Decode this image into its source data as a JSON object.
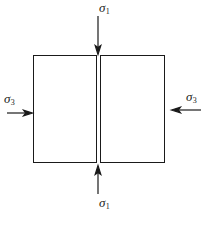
{
  "figure": {
    "background_color": "#ffffff",
    "stroke_color": "#1a1a1a",
    "width": 206,
    "height": 229
  },
  "specimen": {
    "name": "split-rectangular-specimen",
    "blocks": [
      {
        "id": "left-block",
        "x": 33,
        "y": 55,
        "width": 64,
        "height": 108
      },
      {
        "id": "right-block",
        "x": 100,
        "y": 55,
        "width": 65,
        "height": 108
      }
    ],
    "split_gap_px": 3
  },
  "stresses": [
    {
      "id": "sigma1-top",
      "symbol": "σ",
      "subscript": "1",
      "label": "σ1",
      "direction": "down",
      "position": "top",
      "arrow": {
        "x1": 98,
        "y1": 16,
        "x2": 98,
        "y2": 53
      }
    },
    {
      "id": "sigma1-bottom",
      "symbol": "σ",
      "subscript": "1",
      "label": "σ1",
      "direction": "up",
      "position": "bottom",
      "arrow": {
        "x1": 98,
        "y1": 194,
        "x2": 98,
        "y2": 166
      }
    },
    {
      "id": "sigma3-left",
      "symbol": "σ",
      "subscript": "3",
      "label": "σ3",
      "direction": "right",
      "position": "left",
      "arrow": {
        "x1": 7,
        "y1": 113,
        "x2": 32,
        "y2": 113
      }
    },
    {
      "id": "sigma3-right",
      "symbol": "σ",
      "subscript": "3",
      "label": "σ3",
      "direction": "left",
      "position": "right",
      "arrow": {
        "x1": 201,
        "y1": 110,
        "x2": 172,
        "y2": 110
      }
    }
  ],
  "labels": {
    "sigma1_top": {
      "symbol": "σ",
      "subscript": "1"
    },
    "sigma1_bottom": {
      "symbol": "σ",
      "subscript": "1"
    },
    "sigma3_left": {
      "symbol": "σ",
      "subscript": "3"
    },
    "sigma3_right": {
      "symbol": "σ",
      "subscript": "3"
    }
  }
}
